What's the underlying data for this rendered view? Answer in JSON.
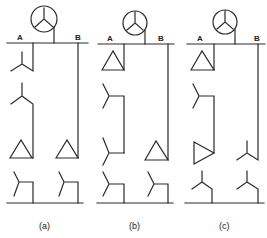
{
  "diagram": {
    "panels": [
      {
        "id": "a",
        "caption": "(a)",
        "bus_labels": {
          "left": "A",
          "right": "B"
        },
        "left_branch": [
          "wye",
          "wye",
          "delta",
          "wye"
        ],
        "right_branch": [
          "delta",
          "wye"
        ]
      },
      {
        "id": "b",
        "caption": "(b)",
        "bus_labels": {
          "left": "A",
          "right": "B"
        },
        "left_branch": [
          "delta",
          "wye",
          "wye",
          "wye"
        ],
        "right_branch": [
          "delta",
          "wye"
        ]
      },
      {
        "id": "c",
        "caption": "(c)",
        "bus_labels": {
          "left": "A",
          "right": "B"
        },
        "left_branch": [
          "delta",
          "wye",
          "delta",
          "wye-grounded"
        ],
        "right_branch": [
          "wye-grounded",
          "wye-grounded"
        ]
      }
    ],
    "source_symbol": "generator-wye-icon"
  }
}
